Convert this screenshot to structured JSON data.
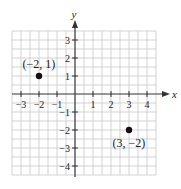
{
  "chart_data": {
    "type": "scatter",
    "title": "",
    "xlabel": "x",
    "ylabel": "y",
    "xlim": [
      -3.5,
      4.5
    ],
    "ylim": [
      -4.5,
      3.5
    ],
    "grid": true,
    "x_ticks": [
      -3,
      -2,
      -1,
      1,
      2,
      3,
      4
    ],
    "x_tick_labels": [
      "−3",
      "−2",
      "−1",
      "1",
      "2",
      "3",
      "4"
    ],
    "y_ticks": [
      -4,
      -3,
      -2,
      -1,
      1,
      2,
      3
    ],
    "y_tick_labels": [
      "−4",
      "−3",
      "−2",
      "−1",
      "1",
      "2",
      "3"
    ],
    "points": [
      {
        "x": -2,
        "y": 1,
        "label": "(−2, 1)",
        "label_position": "above"
      },
      {
        "x": 3,
        "y": -2,
        "label": "(3, −2)",
        "label_position": "below"
      }
    ],
    "colors": {
      "grid": "#c8c8c8",
      "axis": "#333333",
      "point": "#111111"
    }
  }
}
